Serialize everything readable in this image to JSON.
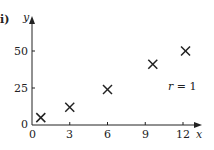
{
  "panel_label": "i)",
  "chart_data": {
    "type": "scatter",
    "title": "",
    "xlabel": "x",
    "ylabel": "y",
    "xlim": [
      0,
      13.5
    ],
    "ylim": [
      0,
      57
    ],
    "xticks": [
      0,
      3,
      6,
      9,
      12
    ],
    "yticks": [
      0,
      25,
      50
    ],
    "grid": false,
    "legend": null,
    "marker": "x",
    "points": [
      {
        "x": 0.7,
        "y": 5
      },
      {
        "x": 3,
        "y": 12
      },
      {
        "x": 6,
        "y": 24
      },
      {
        "x": 9.6,
        "y": 41
      },
      {
        "x": 12.2,
        "y": 50
      }
    ],
    "annotations": [
      {
        "text": "r = 1",
        "x": 12,
        "y": 26
      }
    ]
  },
  "labels": {
    "x_axis": "x",
    "y_axis": "y",
    "annotation": "r = 1",
    "xtick_0": "0",
    "xtick_3": "3",
    "xtick_6": "6",
    "xtick_9": "9",
    "xtick_12": "12",
    "ytick_0": "0",
    "ytick_25": "25",
    "ytick_50": "50"
  },
  "colors": {
    "ink": "#222222",
    "background": "#ffffff"
  }
}
